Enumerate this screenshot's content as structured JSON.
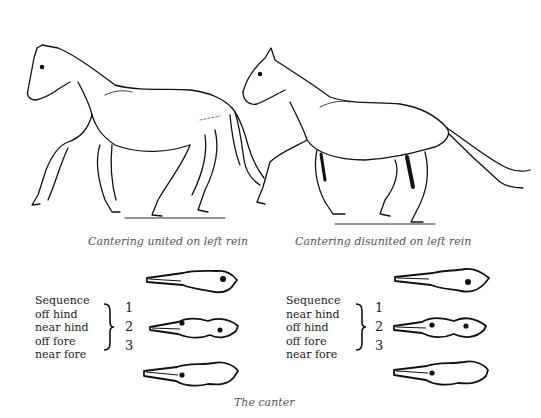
{
  "figure": {
    "title": "The canter",
    "left": {
      "caption": "Cantering united on left rein",
      "sequence_label": "Sequence",
      "sequence": [
        "off hind",
        "near hind",
        "off fore",
        "near fore"
      ],
      "numbers": [
        "1",
        "2",
        "3"
      ],
      "footprints": [
        {
          "step": "1",
          "dots": 1
        },
        {
          "step": "2",
          "dots": 2
        },
        {
          "step": "3",
          "dots": 1
        }
      ]
    },
    "right": {
      "caption": "Cantering disunited on left rein",
      "sequence_label": "Sequence",
      "sequence": [
        "near hind",
        "off hind",
        "off fore",
        "near fore"
      ],
      "numbers": [
        "1",
        "2",
        "3"
      ],
      "footprints": [
        {
          "step": "1",
          "dots": 1
        },
        {
          "step": "2",
          "dots": 2
        },
        {
          "step": "3",
          "dots": 1
        }
      ]
    }
  }
}
